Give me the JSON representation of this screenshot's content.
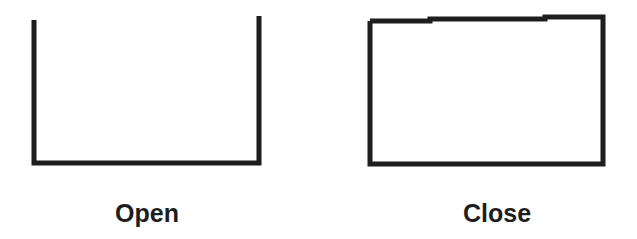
{
  "diagram": {
    "open": {
      "label": "Open"
    },
    "close": {
      "label": "Close"
    },
    "colors": {
      "stroke": "#1e1e1e",
      "background": "#ffffff"
    }
  }
}
